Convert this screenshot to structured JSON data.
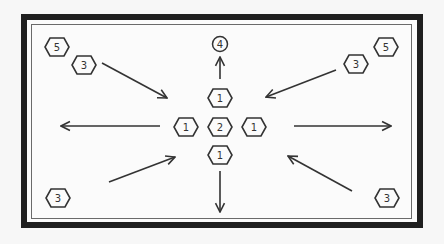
{
  "diagram": {
    "center": {
      "hexes": [
        {
          "id": "top",
          "label": "1",
          "cx": 220,
          "cy": 126,
          "dy": -28
        },
        {
          "id": "left",
          "label": "1",
          "cx": 186,
          "cy": 127
        },
        {
          "id": "middle",
          "label": "2",
          "cx": 220,
          "cy": 127
        },
        {
          "id": "right",
          "label": "1",
          "cx": 254,
          "cy": 127
        },
        {
          "id": "bottom",
          "label": "1",
          "cx": 220,
          "cy": 155
        }
      ]
    },
    "top_node": {
      "label": "4",
      "shape": "circle"
    },
    "corner_nodes": {
      "top_left_outer": "5",
      "top_left_inner": "3",
      "top_right_outer": "5",
      "top_right_inner": "3",
      "bottom_left": "3",
      "bottom_right": "3"
    },
    "arrows": [
      {
        "name": "arrow-up",
        "direction": "up"
      },
      {
        "name": "arrow-down",
        "direction": "down"
      },
      {
        "name": "arrow-left",
        "direction": "left"
      },
      {
        "name": "arrow-right",
        "direction": "right"
      },
      {
        "name": "arrow-from-top-left",
        "direction": "inward"
      },
      {
        "name": "arrow-from-top-right",
        "direction": "inward"
      },
      {
        "name": "arrow-from-bottom-left",
        "direction": "inward"
      },
      {
        "name": "arrow-from-bottom-right",
        "direction": "inward"
      }
    ],
    "colors": {
      "outer_border": "#1f1f1f",
      "inner_border": "#6a6a6a",
      "stroke": "#333333",
      "background": "#fbfbfb"
    }
  }
}
